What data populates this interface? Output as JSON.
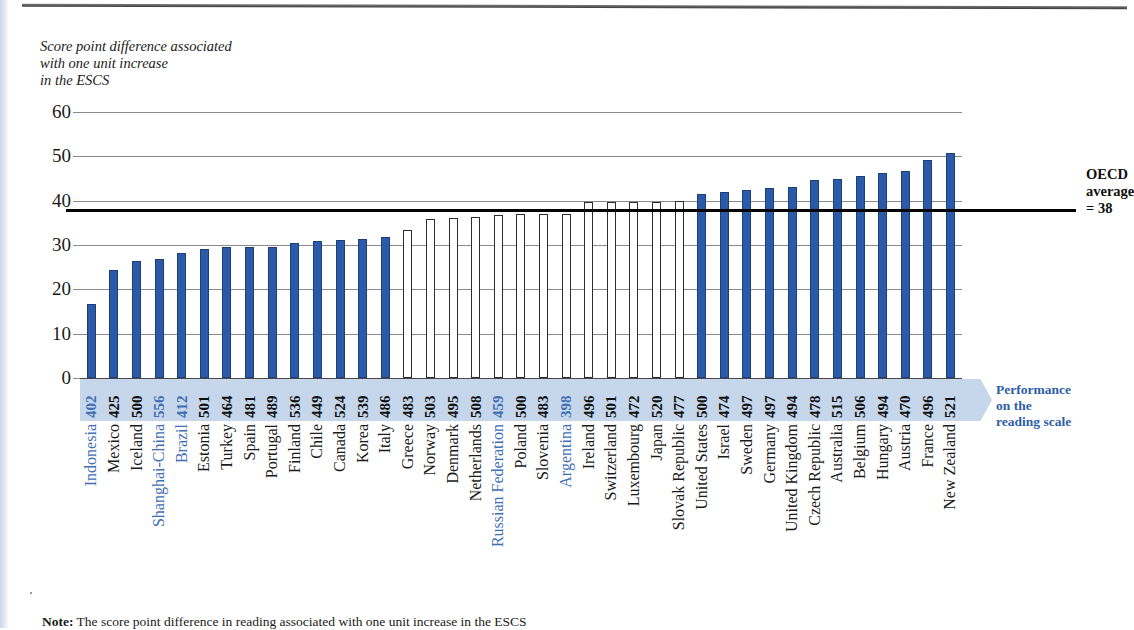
{
  "axis_caption": "Score point difference associated\nwith one unit increase\nin the ESCS",
  "y_axis": {
    "ticks": [
      0,
      10,
      20,
      30,
      40,
      50,
      60
    ],
    "min": 0,
    "max": 60
  },
  "oecd_average": {
    "value": 38,
    "label": "OECD\naverage\n= 38"
  },
  "performance_flag": {
    "label": "Performance\non the\nreading scale"
  },
  "note": {
    "prefix": "Note:",
    "text": " The score point difference in reading associated with one unit increase in the ESCS"
  },
  "chart_data": {
    "type": "bar",
    "title": "",
    "xlabel": "",
    "ylabel": "Score point difference associated with one unit increase in the ESCS",
    "ylim": [
      0,
      60
    ],
    "grid": true,
    "reference_line": {
      "name": "OECD average",
      "value": 38
    },
    "categories": [
      "Indonesia",
      "Mexico",
      "Iceland",
      "Shanghai-China",
      "Brazil",
      "Estonia",
      "Turkey",
      "Spain",
      "Portugal",
      "Finland",
      "Chile",
      "Canada",
      "Korea",
      "Italy",
      "Greece",
      "Norway",
      "Denmark",
      "Netherlands",
      "Russian Federation",
      "Poland",
      "Slovenia",
      "Argentina",
      "Ireland",
      "Switzerland",
      "Luxembourg",
      "Japan",
      "Slovak Republic",
      "United States",
      "Israel",
      "Sweden",
      "Germany",
      "United Kingdom",
      "Czech Republic",
      "Australia",
      "Belgium",
      "Hungary",
      "Austria",
      "France",
      "New Zealand"
    ],
    "values": [
      16.8,
      24.4,
      26.5,
      26.8,
      28.3,
      29.2,
      29.5,
      29.6,
      29.6,
      30.5,
      30.8,
      31.2,
      31.4,
      31.9,
      33.4,
      35.8,
      36.2,
      36.4,
      36.7,
      36.9,
      37.0,
      37.1,
      39.6,
      39.8,
      39.8,
      39.8,
      39.9,
      41.6,
      42.0,
      42.4,
      42.8,
      43.1,
      44.6,
      44.8,
      45.6,
      46.2,
      46.6,
      49.1,
      50.7
    ],
    "reading_scores": [
      402,
      425,
      500,
      556,
      412,
      501,
      464,
      481,
      489,
      536,
      449,
      524,
      539,
      486,
      483,
      503,
      495,
      508,
      459,
      500,
      483,
      398,
      496,
      501,
      472,
      520,
      477,
      500,
      474,
      497,
      497,
      494,
      478,
      515,
      506,
      494,
      470,
      496,
      521
    ],
    "significant": [
      true,
      true,
      true,
      true,
      true,
      true,
      true,
      true,
      true,
      true,
      true,
      true,
      true,
      true,
      false,
      false,
      false,
      false,
      false,
      false,
      false,
      false,
      false,
      false,
      false,
      false,
      false,
      true,
      true,
      true,
      true,
      true,
      true,
      true,
      true,
      true,
      true,
      true,
      true
    ],
    "highlighted": [
      true,
      false,
      false,
      true,
      true,
      false,
      false,
      false,
      false,
      false,
      false,
      false,
      false,
      false,
      false,
      false,
      false,
      false,
      true,
      false,
      false,
      true,
      false,
      false,
      false,
      false,
      false,
      false,
      false,
      false,
      false,
      false,
      false,
      false,
      false,
      false,
      false,
      false,
      false
    ],
    "colors": {
      "bar_significant": "#2b5ba8",
      "bar_not_significant": "#ffffff",
      "highlight_text": "#3f6fb5",
      "band": "#c6d7ec",
      "reference_line": "#000000"
    },
    "legend": []
  }
}
